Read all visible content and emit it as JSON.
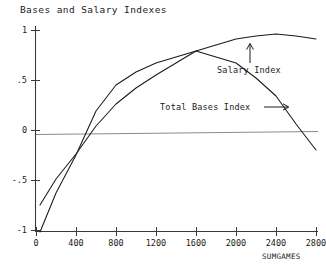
{
  "chart_data": {
    "type": "line",
    "title": "Bases and Salary Indexes",
    "xlabel": "SUMGAMES",
    "ylabel": "",
    "xlim": [
      0,
      2800
    ],
    "ylim": [
      -1.05,
      1.05
    ],
    "grid": false,
    "legend_position": "inline-annotations",
    "xticks": [
      0,
      400,
      800,
      1200,
      1600,
      2000,
      2400,
      2800
    ],
    "xtick_labels": [
      "0",
      "400",
      "800",
      "1200",
      "1600",
      "2000",
      "2400",
      "2800"
    ],
    "yticks": [
      1,
      0.5,
      0,
      -0.5,
      -1
    ],
    "ytick_labels": [
      "1",
      ".5",
      "0",
      "-.5",
      "-1"
    ],
    "reference_line": {
      "y": 0,
      "label": "zero"
    },
    "series": [
      {
        "name": "Total Bases Index",
        "x": [
          40,
          200,
          400,
          600,
          800,
          1000,
          1200,
          1400,
          1600,
          1800,
          2000,
          2200,
          2400,
          2600,
          2800
        ],
        "values": [
          -0.75,
          -0.49,
          -0.24,
          0.04,
          0.26,
          0.42,
          0.55,
          0.67,
          0.79,
          0.73,
          0.67,
          0.52,
          0.34,
          0.06,
          -0.2
        ]
      },
      {
        "name": "Salary Index",
        "x": [
          40,
          200,
          400,
          600,
          800,
          1000,
          1200,
          1400,
          1600,
          1800,
          2000,
          2200,
          2400,
          2600,
          2800
        ],
        "values": [
          -1.02,
          -0.63,
          -0.25,
          0.19,
          0.45,
          0.58,
          0.67,
          0.73,
          0.79,
          0.85,
          0.91,
          0.94,
          0.96,
          0.94,
          0.91
        ]
      }
    ],
    "annotations": [
      {
        "text": "Salary Index",
        "marker": "up-arrow",
        "target_series": "Salary Index"
      },
      {
        "text": "Total Bases Index",
        "marker": "right-arrow",
        "target_series": "Total Bases Index"
      }
    ]
  }
}
